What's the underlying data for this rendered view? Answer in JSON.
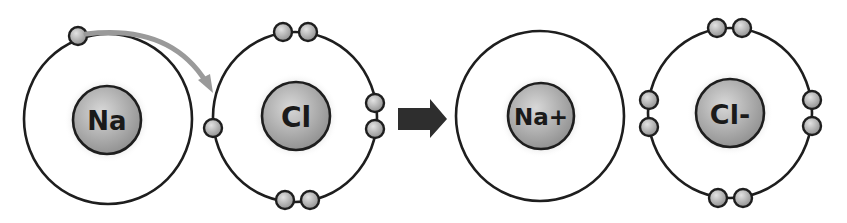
{
  "diagram": {
    "colors": {
      "background": "#ffffff",
      "stroke": "#1e1e1e",
      "nucleus_light": "#d4d4d4",
      "nucleus_dark": "#8a8a8a",
      "electron_light": "#dcdcdc",
      "electron_dark": "#8c8c8c",
      "halo": "#e4e4e4",
      "transfer_arrow": "#9a9a9a",
      "reaction_arrow": "#2e2e2e"
    },
    "atoms": [
      {
        "id": "na",
        "label": "Na",
        "label_size": 26,
        "orbit": {
          "cx": 108,
          "cy": 119,
          "rx": 84,
          "ry": 85
        },
        "nucleus": {
          "cx": 107,
          "cy": 120,
          "r": 34
        },
        "electrons": [
          {
            "cx": 78,
            "cy": 36
          }
        ]
      },
      {
        "id": "cl",
        "label": "Cl",
        "label_size": 28,
        "orbit": {
          "cx": 295,
          "cy": 117,
          "rx": 82,
          "ry": 85
        },
        "nucleus": {
          "cx": 296,
          "cy": 116,
          "r": 34
        },
        "electrons": [
          {
            "cx": 283,
            "cy": 32
          },
          {
            "cx": 308,
            "cy": 32
          },
          {
            "cx": 375,
            "cy": 103
          },
          {
            "cx": 375,
            "cy": 129
          },
          {
            "cx": 285,
            "cy": 200
          },
          {
            "cx": 310,
            "cy": 200
          },
          {
            "cx": 213,
            "cy": 128
          }
        ]
      },
      {
        "id": "na-ion",
        "label": "Na+",
        "label_size": 23,
        "orbit": {
          "cx": 540,
          "cy": 116,
          "rx": 84,
          "ry": 85
        },
        "nucleus": {
          "cx": 541,
          "cy": 116,
          "r": 33
        },
        "electrons": []
      },
      {
        "id": "cl-ion",
        "label": "Cl-",
        "label_size": 27,
        "orbit": {
          "cx": 730,
          "cy": 113,
          "rx": 82,
          "ry": 85
        },
        "nucleus": {
          "cx": 730,
          "cy": 113,
          "r": 34
        },
        "electrons": [
          {
            "cx": 717,
            "cy": 28
          },
          {
            "cx": 742,
            "cy": 28
          },
          {
            "cx": 812,
            "cy": 100
          },
          {
            "cx": 812,
            "cy": 126
          },
          {
            "cx": 718,
            "cy": 198
          },
          {
            "cx": 743,
            "cy": 198
          },
          {
            "cx": 649,
            "cy": 100
          },
          {
            "cx": 649,
            "cy": 127
          }
        ]
      }
    ],
    "electron_radius": 9,
    "transfer_arrow": {
      "description": "electron transfer from Na to Cl",
      "path": "M 86 34 Q 170 24 206 82",
      "head": "213,93 198,80 210,74"
    },
    "reaction_arrow": {
      "description": "reaction yields",
      "points": "398,108 430,108 430,99 447,119 430,138 430,130 398,130"
    }
  }
}
